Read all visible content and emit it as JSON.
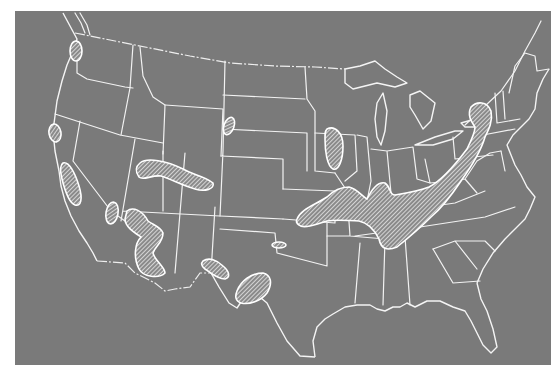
{
  "figure": {
    "type": "map",
    "colors": {
      "background": "#7a7a7a",
      "boundaries": "#f2f2f2",
      "hatch": "#ffffff",
      "page": "#ffffff"
    },
    "legend": null,
    "title": null
  },
  "hatched_regions": [
    {
      "id": "washington-puget-sound",
      "area": "Western Washington"
    },
    {
      "id": "northern-california-interior",
      "area": "Northern California"
    },
    {
      "id": "central-california-sierra",
      "area": "Central California"
    },
    {
      "id": "southern-california-desert",
      "area": "Southern California / Nevada border"
    },
    {
      "id": "arizona-rim",
      "area": "Arizona"
    },
    {
      "id": "utah-colorado-plateau",
      "area": "Utah / Colorado"
    },
    {
      "id": "south-dakota-black-hills",
      "area": "Western South Dakota"
    },
    {
      "id": "new-mexico-southeast",
      "area": "Southern New Mexico"
    },
    {
      "id": "west-texas",
      "area": "West Texas"
    },
    {
      "id": "oklahoma-small",
      "area": "Southern Oklahoma"
    },
    {
      "id": "wisconsin-illinois",
      "area": "Wisconsin / Illinois border"
    },
    {
      "id": "appalachian-band",
      "area": "Missouri through Appalachians to New England"
    }
  ]
}
